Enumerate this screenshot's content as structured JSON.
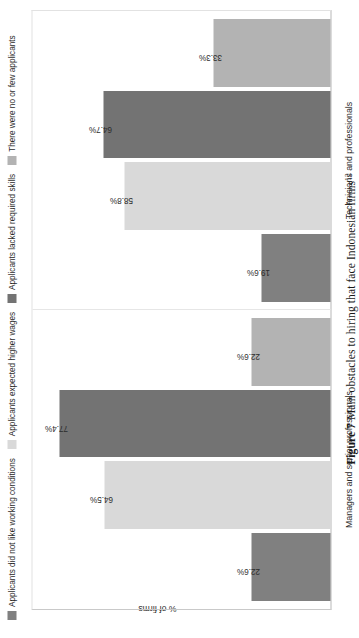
{
  "figure": {
    "caption_lead": "Figure 7",
    "caption_text": "Main obstacles to hiring that face Indonesian firms",
    "caption_footnote": "12"
  },
  "legend": {
    "items": [
      {
        "label": "Applicants did not like working conditions",
        "color": "#808080"
      },
      {
        "label": "Applicants expected higher wages",
        "color": "#d9d9d9"
      },
      {
        "label": "Applicants lacked required skills",
        "color": "#737373"
      },
      {
        "label": "There were no or few applicants",
        "color": "#b3b3b3"
      }
    ]
  },
  "axis": {
    "ylabel": "% of firms"
  },
  "chart_data": {
    "type": "bar",
    "title": "Main obstacles to hiring that face Indonesian firms",
    "xlabel": "",
    "ylabel": "% of firms",
    "ylim": [
      0,
      85
    ],
    "grid": false,
    "legend_position": "top-left",
    "categories": [
      "Managers and senior professionals",
      "Technicians and professionals"
    ],
    "series": [
      {
        "name": "Applicants did not like working conditions",
        "color": "#808080",
        "values": [
          22.6,
          19.6
        ],
        "labels": [
          "22.6%",
          "19.6%"
        ]
      },
      {
        "name": "Applicants expected higher wages",
        "color": "#d9d9d9",
        "values": [
          64.5,
          58.8
        ],
        "labels": [
          "64.5%",
          "58.8%"
        ]
      },
      {
        "name": "Applicants lacked required skills",
        "color": "#737373",
        "values": [
          77.4,
          64.7
        ],
        "labels": [
          "77.4%",
          "64.7%"
        ]
      },
      {
        "name": "There were no or few applicants",
        "color": "#b3b3b3",
        "values": [
          22.6,
          33.3
        ],
        "labels": [
          "22.6%",
          "33.3%"
        ]
      }
    ]
  }
}
